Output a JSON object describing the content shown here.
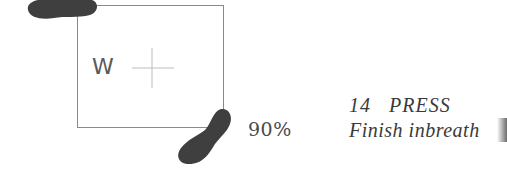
{
  "diagram": {
    "mat": {
      "label": "W",
      "border_color": "#8a8a8a",
      "has_center_crosshair": true
    },
    "footprints": [
      {
        "name": "left-foot",
        "position": "top-left corner",
        "color": "#3f3f3f"
      },
      {
        "name": "right-foot",
        "position": "bottom-right corner",
        "color": "#3f3f3f"
      }
    ],
    "percentage": "90%",
    "step": {
      "number": "14",
      "title": "PRESS",
      "description": "Finish inbreath"
    }
  }
}
